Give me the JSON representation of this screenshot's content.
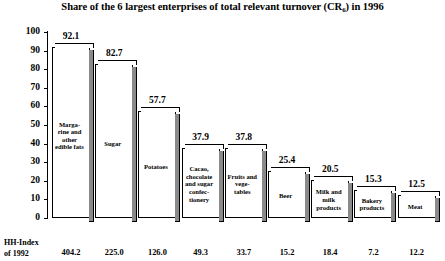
{
  "chart_data": {
    "type": "bar",
    "title_prefix": "Share of the 6 largest enterprises of total relevant turnover (CR",
    "title_subscript": "6",
    "title_suffix": ") in 1996",
    "xlabel": "",
    "ylabel": "",
    "ylim": [
      0,
      100
    ],
    "ytick_labels": [
      "100",
      "90",
      "80",
      "70",
      "60",
      "50",
      "40",
      "30",
      "20",
      "10",
      "0"
    ],
    "ytick_values": [
      100,
      90,
      80,
      70,
      60,
      50,
      40,
      30,
      20,
      10,
      0
    ],
    "grid": false,
    "legend": false,
    "categories": [
      "Marga-\nrine and\nother\nedible fats",
      "Sugar",
      "Potatoes",
      "Cacao,\nchocolate\nand sugar\nconfec-\ntionery",
      "Fruits and\nvege-\ntables",
      "Beer",
      "Milk and\nmilk\nproducts",
      "Bakery\nproducts",
      "Meat"
    ],
    "values": [
      92.1,
      82.7,
      57.7,
      37.9,
      37.8,
      25.4,
      20.5,
      15.3,
      12.5
    ],
    "value_labels": [
      "92.1",
      "82.7",
      "57.7",
      "37.9",
      "37.8",
      "25.4",
      "20.5",
      "15.3",
      "12.5"
    ],
    "secondary_axis_caption": "HH-Index\nof 1992",
    "secondary_values": [
      404.2,
      225.0,
      126.0,
      49.3,
      33.7,
      15.2,
      18.4,
      7.2,
      12.2
    ],
    "secondary_value_labels": [
      "404.2",
      "225.0",
      "126.0",
      "49.3",
      "33.7",
      "15.2",
      "18.4",
      "7.2",
      "12.2"
    ],
    "colors": {
      "bar_face": "#ffffff",
      "bar_outline": "#000000",
      "bar_shadow": "#8a8a8a",
      "text": "#000000",
      "background": "#ffffff"
    }
  }
}
